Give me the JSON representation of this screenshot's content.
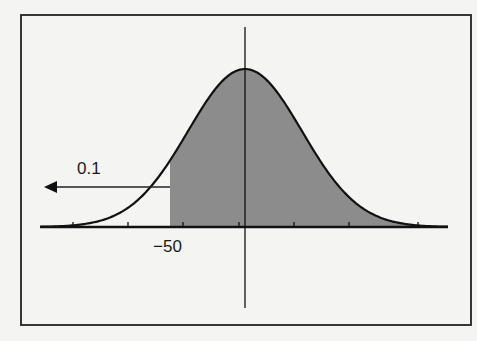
{
  "chart_data": {
    "type": "area",
    "title": "",
    "distribution": {
      "kind": "normal",
      "mean": 0
    },
    "shaded_region": {
      "from": -50,
      "to": "inf"
    },
    "annotations": [
      {
        "text": "0.1",
        "type": "arrow-left",
        "meaning": "tail area left of -50"
      },
      {
        "text": "−50",
        "type": "x-label",
        "x": -50
      }
    ],
    "xlabel": "",
    "ylabel": "",
    "x_tick_labels": [
      "−50"
    ],
    "grid": false,
    "legend": null,
    "colors": {
      "shade": "#8c8c8c",
      "line": "#111111",
      "background": "#f4f4f2"
    }
  },
  "labels": {
    "tail_area": "0.1",
    "cutoff": "−50"
  }
}
